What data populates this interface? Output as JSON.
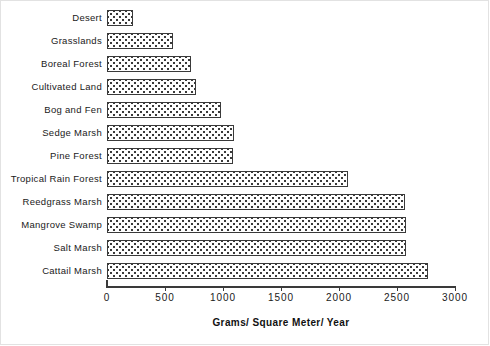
{
  "chart_data": {
    "type": "bar",
    "orientation": "horizontal",
    "title": "",
    "xlabel": "Grams/ Square Meter/ Year",
    "ylabel": "",
    "xlim": [
      0,
      3000
    ],
    "xticks": [
      0,
      500,
      1000,
      1500,
      2000,
      2500,
      3000
    ],
    "xtick_labels": [
      "0",
      "500",
      "1000",
      "1500",
      "2000",
      "2500",
      "3000"
    ],
    "grid": false,
    "legend": false,
    "categories": [
      "Desert",
      "Grasslands",
      "Boreal  Forest",
      "Cultivated  Land",
      "Bog and Fen",
      "Sedge Marsh",
      "Pine  Forest",
      "Tropical  Rain  Forest",
      "Reedgrass Marsh",
      "Mangrove Swamp",
      "Salt  Marsh",
      "Cattail  Marsh"
    ],
    "values": [
      220,
      570,
      720,
      770,
      985,
      1095,
      1090,
      2080,
      2570,
      2575,
      2575,
      2770
    ],
    "bar_style": {
      "fill": "dotted-stipple",
      "fill_color": "#ffffff",
      "dot_color": "#2b2b2b",
      "edge_color": "#3a3a3a"
    },
    "axis_color": "#3a3a3a",
    "text_color": "#1a1a1a"
  }
}
